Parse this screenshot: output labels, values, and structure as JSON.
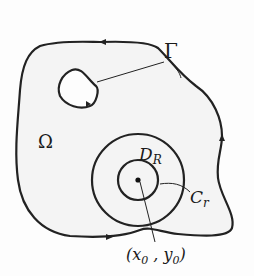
{
  "figure": {
    "labels": {
      "boundary": "Γ",
      "region": "Ω",
      "disk": "D",
      "disk_sub": "R",
      "circle": "C",
      "circle_sub": "r",
      "point_open": "(x",
      "point_x_sub": "0",
      "point_mid": " , y",
      "point_y_sub": "0",
      "point_close": ")"
    },
    "colors": {
      "stroke": "#222222",
      "fill": "#f4f4f4",
      "background": "#fdfdfd"
    },
    "geometry": {
      "center": [
        138,
        180
      ],
      "disk_radius": 46,
      "circle_radius": 20,
      "hole_center": [
        77,
        90
      ]
    }
  }
}
